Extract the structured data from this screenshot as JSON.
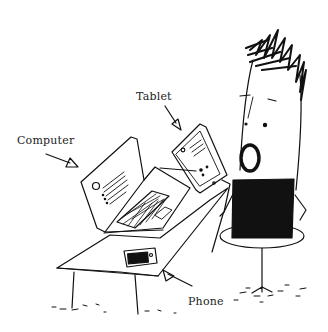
{
  "illustration": {
    "description": "Hand-drawn cartoon of a person sitting at a table with a laptop computer, a tablet and a phone",
    "labels": {
      "computer": "Computer",
      "tablet": "Tablet",
      "phone": "Phone"
    },
    "colors": {
      "ink": "#111111",
      "background": "#ffffff"
    }
  }
}
